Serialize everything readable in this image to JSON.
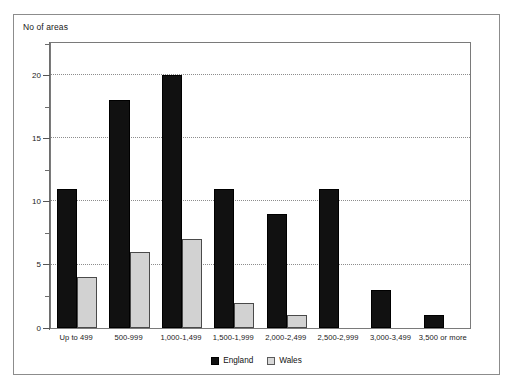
{
  "chart_data": {
    "type": "bar",
    "title": "",
    "ylabel": "No of areas",
    "xlabel": "",
    "ylim": [
      0,
      22.5
    ],
    "yticks": [
      0,
      5,
      10,
      15,
      20
    ],
    "ytick_labels": [
      "0",
      "5",
      "10",
      "15",
      "20"
    ],
    "yminor_ticks": [
      2.5,
      7.5,
      12.5,
      17.5,
      22
    ],
    "grid": "horizontal-dotted",
    "legend_position": "bottom-center",
    "categories": [
      "Up to 499",
      "500-999",
      "1,000-1,499",
      "1,500-1,999",
      "2,000-2,499",
      "2,500-2,999",
      "3,000-3,499",
      "3,500 or more"
    ],
    "series": [
      {
        "name": "England",
        "color": "#111111",
        "values": [
          11,
          18,
          20,
          11,
          9,
          11,
          3,
          1
        ]
      },
      {
        "name": "Wales",
        "color": "#d2d2d2",
        "values": [
          4,
          6,
          7,
          2,
          1,
          0,
          0,
          0
        ]
      }
    ]
  },
  "legend": {
    "items": [
      {
        "label": "England",
        "swatch": "black-square-swatch"
      },
      {
        "label": "Wales",
        "swatch": "light-grey-square-swatch"
      }
    ]
  }
}
